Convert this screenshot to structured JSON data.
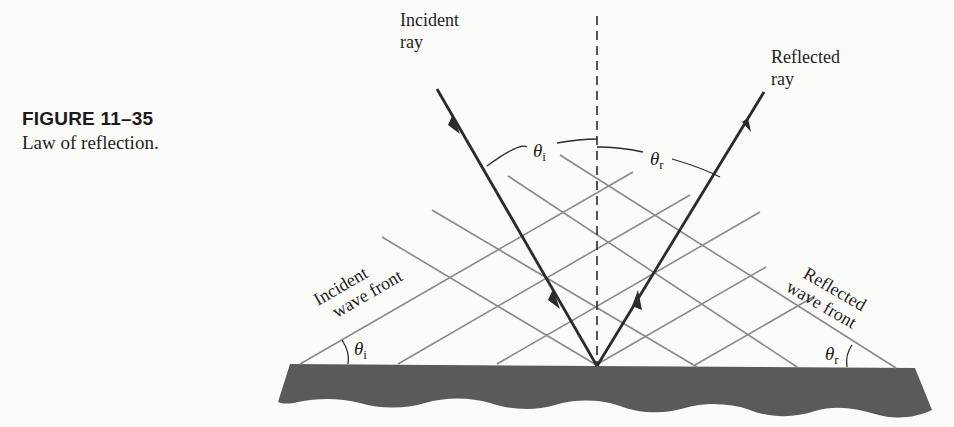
{
  "figure": {
    "number": "FIGURE 11–35",
    "title": "Law of reflection."
  },
  "labels": {
    "incident_ray": [
      "Incident",
      "ray"
    ],
    "reflected_ray": [
      "Reflected",
      "ray"
    ],
    "incident_wave_front": [
      "Incident",
      "wave front"
    ],
    "reflected_wave_front": [
      "Reflected",
      "wave front"
    ],
    "theta_symbol": "θ",
    "theta_i_sub": "i",
    "theta_r_sub": "r"
  },
  "colors": {
    "ray": "#2b2b2b",
    "wave_front": "#8a8a8a",
    "surface": "#5a5a5a",
    "normal": "#2b2b2b"
  }
}
